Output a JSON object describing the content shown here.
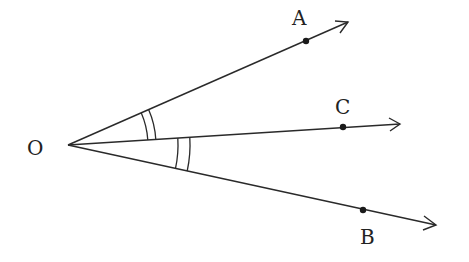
{
  "diagram": {
    "type": "geometry-angle-bisector",
    "origin": {
      "label": "O",
      "x": 68,
      "y": 145,
      "label_x": 27,
      "label_y": 155
    },
    "rays": [
      {
        "name": "OA",
        "end_x": 348,
        "end_y": 22,
        "point": {
          "label": "A",
          "x": 306,
          "y": 41,
          "label_x": 292,
          "label_y": 25
        }
      },
      {
        "name": "OC",
        "end_x": 400,
        "end_y": 124,
        "point": {
          "label": "C",
          "x": 343,
          "y": 127,
          "label_x": 335,
          "label_y": 114
        }
      },
      {
        "name": "OB",
        "end_x": 436,
        "end_y": 225,
        "point": {
          "label": "B",
          "x": 363,
          "y": 210,
          "label_x": 360,
          "label_y": 244
        }
      }
    ],
    "angle_marks": [
      {
        "between": "AOC",
        "arcs": 2,
        "radii": [
          80,
          88
        ]
      },
      {
        "between": "COB",
        "arcs": 2,
        "radii": [
          110,
          122
        ]
      }
    ],
    "colors": {
      "stroke": "#2a2a2a",
      "text": "#222222",
      "background": "#ffffff"
    }
  }
}
